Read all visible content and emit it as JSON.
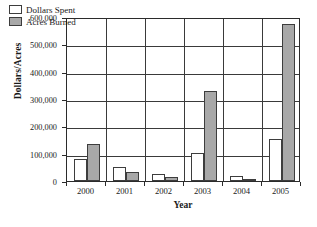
{
  "chart_data": {
    "type": "bar",
    "title": "",
    "xlabel": "Year",
    "ylabel": "Dollars/Acres",
    "categories": [
      "2000",
      "2001",
      "2002",
      "2003",
      "2004",
      "2005"
    ],
    "series": [
      {
        "name": "Dollars Spent",
        "color": "#ffffff",
        "border_color": "#3d3d3d",
        "values": [
          80000,
          50000,
          25000,
          102000,
          18000,
          152000
        ]
      },
      {
        "name": "Acres Burned",
        "color": "#a8a8a8",
        "border_color": "#3d3d3d",
        "values": [
          135000,
          32000,
          15000,
          330000,
          5000,
          575000
        ]
      }
    ],
    "ylim": [
      0,
      600000
    ],
    "ytick_values": [
      0,
      100000,
      200000,
      300000,
      400000,
      500000,
      600000
    ],
    "ytick_labels": [
      "0",
      "100,000",
      "200,000",
      "300,000",
      "400,000",
      "500,000",
      "600,000"
    ],
    "grid": true,
    "grid_axis": "y",
    "legend_position": "upper-left-inside",
    "frame": true
  },
  "legend": {
    "items": [
      {
        "label": "Dollars Spent",
        "series": "series-dollars"
      },
      {
        "label": "Acres Burned",
        "series": "series-acres"
      }
    ]
  }
}
